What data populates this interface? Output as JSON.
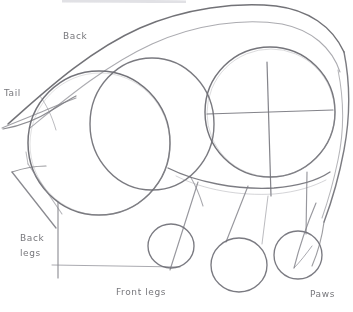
{
  "drawing": {
    "title": "Animal construction sketch",
    "medium": "pencil",
    "background_color": "#ffffff",
    "line_color": "#6f6f74",
    "faint_line_color": "#9b9ba0"
  },
  "labels": {
    "back": "Back",
    "tail": "Tail",
    "back_legs": "Back legs",
    "front_legs": "Front legs",
    "paws": "Paws"
  },
  "shapes": {
    "head_circle": {
      "cx": 270,
      "cy": 112,
      "r": 65
    },
    "hip_circle": {
      "cx": 99,
      "cy": 143,
      "r": 71
    },
    "mid_circle": {
      "cx": 152,
      "cy": 124,
      "r": 62
    },
    "paw_circle_1": {
      "cx": 171,
      "cy": 246,
      "r": 23
    },
    "paw_circle_2": {
      "cx": 239,
      "cy": 265,
      "r": 28
    },
    "paw_circle_3": {
      "cx": 298,
      "cy": 255,
      "r": 24
    }
  }
}
